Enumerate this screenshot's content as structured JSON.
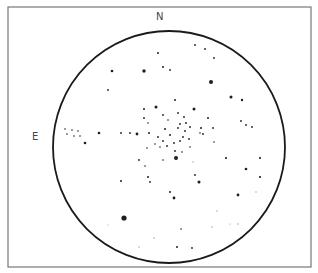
{
  "sketch": {
    "labels": {
      "north": "N",
      "east": "E"
    },
    "frame": {
      "x": 8,
      "y": 7,
      "width": 303,
      "height": 260,
      "color": "#777777"
    },
    "field": {
      "cx": 169,
      "cy": 147,
      "rx": 116,
      "ry": 116,
      "color": "#1a1a1a"
    },
    "stars": [
      [
        195,
        45,
        0.9
      ],
      [
        205,
        49,
        0.9
      ],
      [
        158,
        53,
        1.0
      ],
      [
        214,
        58,
        0.9
      ],
      [
        112,
        71,
        1.3
      ],
      [
        144,
        71,
        1.7
      ],
      [
        163,
        67,
        1.0
      ],
      [
        170,
        70,
        0.9
      ],
      [
        211,
        82,
        2.0
      ],
      [
        108,
        90,
        0.9
      ],
      [
        231,
        97,
        1.5
      ],
      [
        242,
        100,
        1.2
      ],
      [
        156,
        107,
        1.5
      ],
      [
        194,
        109,
        1.5
      ],
      [
        175,
        100,
        1.0
      ],
      [
        144,
        109,
        1.0
      ],
      [
        208,
        118,
        1.0
      ],
      [
        144,
        118,
        0.9
      ],
      [
        148,
        123,
        0.8
      ],
      [
        65,
        129,
        0.8
      ],
      [
        72,
        130,
        0.8
      ],
      [
        78,
        131,
        0.8
      ],
      [
        67,
        134,
        0.8
      ],
      [
        74,
        136,
        0.8
      ],
      [
        80,
        136,
        0.8
      ],
      [
        85,
        143,
        1.3
      ],
      [
        99,
        133,
        1.3
      ],
      [
        121,
        133,
        0.9
      ],
      [
        130,
        133,
        0.9
      ],
      [
        137,
        134,
        1.4
      ],
      [
        149,
        133,
        1.0
      ],
      [
        241,
        121,
        0.9
      ],
      [
        246,
        125,
        0.9
      ],
      [
        252,
        127,
        0.9
      ],
      [
        163,
        115,
        0.9
      ],
      [
        168,
        120,
        0.8
      ],
      [
        178,
        113,
        0.9
      ],
      [
        184,
        117,
        0.9
      ],
      [
        186,
        123,
        0.9
      ],
      [
        180,
        124,
        0.9
      ],
      [
        165,
        129,
        1.0
      ],
      [
        170,
        135,
        1.0
      ],
      [
        178,
        128,
        0.9
      ],
      [
        185,
        131,
        0.9
      ],
      [
        190,
        127,
        0.9
      ],
      [
        183,
        137,
        0.9
      ],
      [
        158,
        137,
        0.9
      ],
      [
        163,
        141,
        0.9
      ],
      [
        155,
        144,
        0.8
      ],
      [
        167,
        146,
        0.9
      ],
      [
        174,
        143,
        0.9
      ],
      [
        180,
        141,
        0.9
      ],
      [
        189,
        139,
        0.9
      ],
      [
        160,
        147,
        0.8
      ],
      [
        175,
        151,
        0.9
      ],
      [
        182,
        152,
        0.8
      ],
      [
        190,
        147,
        0.8
      ],
      [
        147,
        148,
        0.8
      ],
      [
        201,
        128,
        1.0
      ],
      [
        203,
        134,
        0.9
      ],
      [
        213,
        128,
        0.9
      ],
      [
        214,
        142,
        0.8
      ],
      [
        200,
        133,
        0.8
      ],
      [
        176,
        158,
        2.0
      ],
      [
        199,
        182,
        1.5
      ],
      [
        246,
        169,
        1.3
      ],
      [
        260,
        158,
        1.1
      ],
      [
        260,
        177,
        1.1
      ],
      [
        238,
        195,
        1.4
      ],
      [
        121,
        181,
        1.0
      ],
      [
        148,
        177,
        1.0
      ],
      [
        150,
        182,
        0.9
      ],
      [
        139,
        160,
        0.9
      ],
      [
        145,
        166,
        0.8
      ],
      [
        163,
        160,
        0.8
      ],
      [
        174,
        198,
        1.4
      ],
      [
        170,
        192,
        1.0
      ],
      [
        195,
        175,
        0.9
      ],
      [
        226,
        158,
        1.1
      ],
      [
        193,
        162,
        0.7
      ],
      [
        124,
        218,
        2.6
      ],
      [
        177,
        247,
        1.0
      ],
      [
        192,
        248,
        0.9
      ],
      [
        181,
        229,
        0.8
      ],
      [
        139,
        247,
        0.7
      ],
      [
        154,
        238,
        0.7
      ],
      [
        212,
        227,
        0.7
      ],
      [
        238,
        224,
        0.7
      ],
      [
        108,
        225,
        0.6
      ],
      [
        217,
        211,
        0.7
      ],
      [
        230,
        224,
        0.6
      ],
      [
        256,
        192,
        0.7
      ]
    ]
  }
}
